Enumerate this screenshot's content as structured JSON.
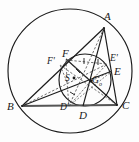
{
  "figure": {
    "width": 139,
    "height": 142,
    "background_color": "#fdfdfd",
    "stroke_color": "#1a1a1a",
    "dashed_color": "#4a4a4a",
    "chord_color": "#555555"
  },
  "labels": {
    "A": "A",
    "B": "B",
    "C": "C",
    "D": "D",
    "D_prime": "D'",
    "E": "E",
    "E_prime": "E'",
    "F": "F",
    "F_prime": "F'",
    "S": "S",
    "G": "G",
    "G_sub": "o"
  },
  "points": {
    "A": {
      "x": 104,
      "y": 28
    },
    "B": {
      "x": 22,
      "y": 106
    },
    "C": {
      "x": 117,
      "y": 105
    },
    "D": {
      "x": 83,
      "y": 106
    },
    "D_prime": {
      "x": 69,
      "y": 106
    },
    "E": {
      "x": 112,
      "y": 71
    },
    "E_prime": {
      "x": 107,
      "y": 64
    },
    "F": {
      "x": 66,
      "y": 59
    },
    "F_prime": {
      "x": 60,
      "y": 65
    },
    "S": {
      "x": 67,
      "y": 82
    },
    "G": {
      "x": 91,
      "y": 81
    }
  },
  "circles": {
    "circumcircle": {
      "cx": 70,
      "cy": 71,
      "r": 62,
      "label": "circumcircle"
    },
    "nine_point_circle": {
      "cx": 85,
      "cy": 80,
      "r": 26,
      "label": "nine-point circle"
    }
  },
  "segments": {
    "triangle_sides": [
      "AB",
      "BC",
      "CA"
    ],
    "cevians": [
      "AD",
      "BE",
      "CF"
    ],
    "medians_dashed": [
      "AD'",
      "BE'",
      "CF'"
    ],
    "radii_dashed": [
      "GF",
      "GE'",
      "GD'",
      "SF'",
      "SD'"
    ]
  },
  "tick_marks": {
    "count": 4,
    "description": "equal-length hatch marks on dashed radii"
  }
}
